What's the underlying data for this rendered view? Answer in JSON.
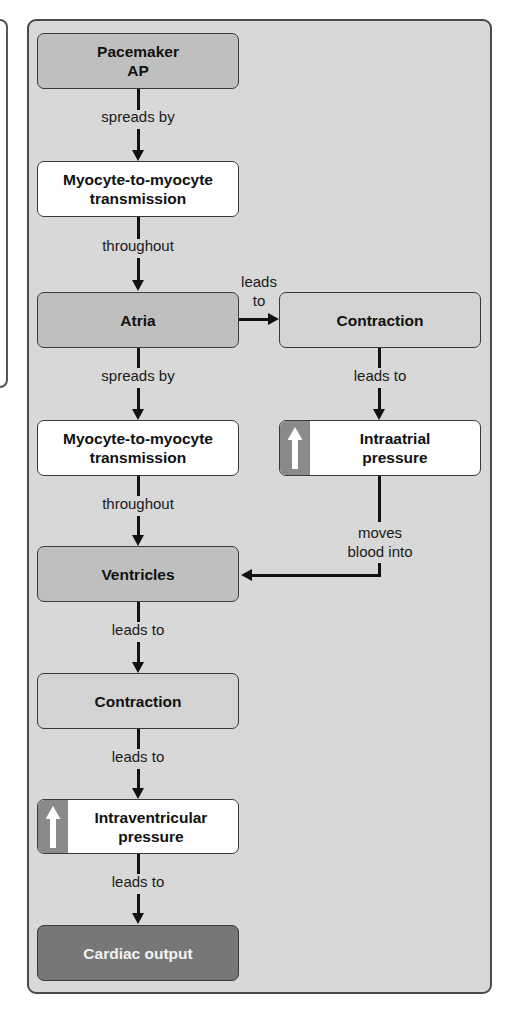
{
  "diagram": {
    "nodes": {
      "pacemaker": {
        "label": "Pacemaker\nAP"
      },
      "myocyte1": {
        "label": "Myocyte-to-myocyte\ntransmission"
      },
      "atria": {
        "label": "Atria"
      },
      "atrial_contraction": {
        "label": "Contraction"
      },
      "myocyte2": {
        "label": "Myocyte-to-myocyte\ntransmission"
      },
      "intraatrial_pressure": {
        "label": "Intraatrial\npressure",
        "indicator": "up-arrow-icon"
      },
      "ventricles": {
        "label": "Ventricles"
      },
      "ventricular_contraction": {
        "label": "Contraction"
      },
      "intraventricular_pressure": {
        "label": "Intraventricular\npressure",
        "indicator": "up-arrow-icon"
      },
      "cardiac_output": {
        "label": "Cardiac output"
      }
    },
    "edges": {
      "pacemaker_to_myocyte1": "spreads by",
      "myocyte1_to_atria": "throughout",
      "atria_to_contraction": "leads\nto",
      "atria_to_myocyte2": "spreads by",
      "contraction_to_intraatrial": "leads to",
      "myocyte2_to_ventricles": "throughout",
      "intraatrial_to_ventricles": "moves\nblood into",
      "ventricles_to_contraction": "leads to",
      "contraction_to_intraventricular": "leads to",
      "intraventricular_to_cardiac_output": "leads to"
    }
  },
  "colors": {
    "panel_bg": "#d8d8d8",
    "mid_box": "#bfbfbf",
    "light_box": "#d3d3d3",
    "white_box": "#ffffff",
    "dark_box": "#777777",
    "indicator_tab": "#8a8a8a"
  }
}
